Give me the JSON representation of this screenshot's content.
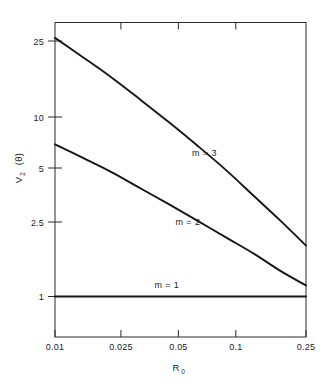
{
  "chart_data": {
    "type": "line",
    "title": "",
    "xlabel": "R_0",
    "xlabel_base": "R",
    "xlabel_sub": "0",
    "ylabel": "V_2 (θ)",
    "ylabel_base": "V",
    "ylabel_sub": "2",
    "ylabel_tail": " (θ)",
    "xscale": "log",
    "yscale": "log",
    "xlim": [
      0.01,
      0.25
    ],
    "ylim": [
      0.8,
      30
    ],
    "grid": false,
    "legend_position": "inline-curve-labels",
    "xticks": [
      0.01,
      0.025,
      0.05,
      0.1,
      0.25
    ],
    "xticklabels": [
      "0.01",
      "0.025",
      "0.05",
      "0.1",
      "0.25"
    ],
    "yticks": [
      1,
      2.5,
      5,
      10,
      25
    ],
    "yticklabels": [
      "1",
      "2.5",
      "5",
      "10",
      "25"
    ],
    "series": [
      {
        "name": "m = 3",
        "label": "m = 3",
        "x": [
          0.01,
          0.0145,
          0.021,
          0.03,
          0.043,
          0.062,
          0.09,
          0.13,
          0.18,
          0.25
        ],
        "values": [
          26.0,
          20.2,
          15.6,
          11.9,
          9.0,
          6.7,
          4.9,
          3.5,
          2.6,
          1.9
        ]
      },
      {
        "name": "m = 2",
        "label": "m = 2",
        "x": [
          0.01,
          0.0145,
          0.021,
          0.03,
          0.043,
          0.062,
          0.09,
          0.13,
          0.18,
          0.25
        ],
        "values": [
          6.8,
          5.7,
          4.75,
          3.9,
          3.2,
          2.6,
          2.1,
          1.7,
          1.38,
          1.15
        ]
      },
      {
        "name": "m = 1",
        "label": "m = 1",
        "x": [
          0.01,
          0.25
        ],
        "values": [
          1.0,
          1.0
        ]
      }
    ],
    "annotations": [
      {
        "text": "m = 3",
        "x": 0.068,
        "y": 5.9
      },
      {
        "text": "m = 2",
        "x": 0.055,
        "y": 2.45
      },
      {
        "text": "m = 1",
        "x": 0.042,
        "y": 1.12
      }
    ]
  },
  "colors": {
    "background": "#ffffff",
    "axis": "#2b2b2b",
    "curve": "#161616",
    "text": "#1a1a1a"
  }
}
